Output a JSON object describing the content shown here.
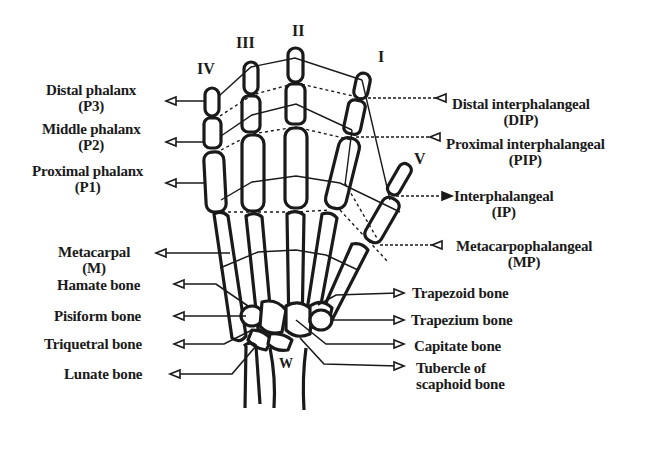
{
  "diagram": {
    "finger_numerals": [
      {
        "id": "IV",
        "label": "IV"
      },
      {
        "id": "III",
        "label": "III"
      },
      {
        "id": "II",
        "label": "II"
      },
      {
        "id": "I",
        "label": "I"
      },
      {
        "id": "V",
        "label": "V"
      }
    ],
    "wrist_label": "W",
    "left_labels": [
      {
        "name": "Distal phalanx",
        "abbr": "(P3)"
      },
      {
        "name": "Middle phalanx",
        "abbr": "(P2)"
      },
      {
        "name": "Proximal phalanx",
        "abbr": "(P1)"
      },
      {
        "name": "Metacarpal",
        "abbr": "(M)"
      },
      {
        "name": "Hamate bone",
        "abbr": ""
      },
      {
        "name": "Pisiform bone",
        "abbr": ""
      },
      {
        "name": "Triquetral bone",
        "abbr": ""
      },
      {
        "name": "Lunate bone",
        "abbr": ""
      }
    ],
    "right_labels": [
      {
        "name": "Distal interphalangeal",
        "abbr": "(DIP)"
      },
      {
        "name": "Proximal interphalangeal",
        "abbr": "(PIP)"
      },
      {
        "name": "Interphalangeal",
        "abbr": "(IP)"
      },
      {
        "name": "Metacarpophalangeal",
        "abbr": "(MP)"
      },
      {
        "name": "Trapezoid bone",
        "abbr": ""
      },
      {
        "name": "Trapezium bone",
        "abbr": ""
      },
      {
        "name": "Capitate bone",
        "abbr": ""
      },
      {
        "name": "Tubercle of",
        "abbr": "scaphoid bone"
      }
    ],
    "colors": {
      "line": "#1a1a1a",
      "background": "#ffffff"
    }
  }
}
